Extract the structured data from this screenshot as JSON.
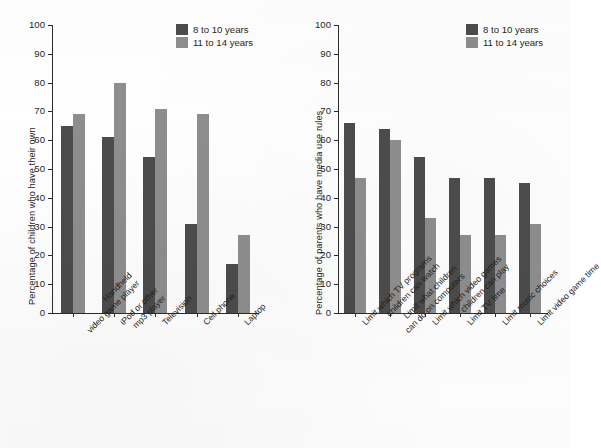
{
  "figure": {
    "background_color": "#ffffff",
    "series_colors": {
      "series_0": "#4c4c4c",
      "series_1": "#8e8e8e"
    }
  },
  "legend": {
    "entries": [
      {
        "label": "8 to 10 years",
        "color": "#4c4c4c"
      },
      {
        "label": "11 to 14 years",
        "color": "#8e8e8e"
      }
    ]
  },
  "chart_data": [
    {
      "type": "bar",
      "id": "children-own-media",
      "title": "",
      "xlabel": "",
      "ylabel": "Percentage of children who have their own",
      "ylim": [
        0,
        100
      ],
      "yticks": [
        0,
        10,
        20,
        30,
        40,
        50,
        60,
        70,
        80,
        90,
        100
      ],
      "ytick_labels": [
        "0",
        "10",
        "20",
        "30",
        "40",
        "50",
        "60",
        "70",
        "80",
        "90",
        "100"
      ],
      "grid": false,
      "legend_position": "top-right",
      "categories": [
        "Handheld\nvideo game player",
        "iPod or other\nmp3 player",
        "Television",
        "Cell phone",
        "Laptop"
      ],
      "series": [
        {
          "name": "8 to 10 years",
          "color": "#4c4c4c",
          "values": [
            65,
            61,
            54,
            31,
            17
          ]
        },
        {
          "name": "11 to 14 years",
          "color": "#8e8e8e",
          "values": [
            69,
            80,
            71,
            69,
            27
          ]
        }
      ]
    },
    {
      "type": "bar",
      "id": "parents-media-rules",
      "title": "",
      "xlabel": "",
      "ylabel": "Percentage of parents who have media use rules",
      "ylim": [
        0,
        100
      ],
      "yticks": [
        0,
        10,
        20,
        30,
        40,
        50,
        60,
        70,
        80,
        90,
        100
      ],
      "ytick_labels": [
        "0",
        "10",
        "20",
        "30",
        "40",
        "50",
        "60",
        "70",
        "80",
        "90",
        "100"
      ],
      "grid": false,
      "legend_position": "top-right",
      "categories": [
        "Limit which TV programs\nchildren can watch",
        "Limit what children\ncan do on computers",
        "Limit which video games\nchildren can play",
        "Limit TV time",
        "Limit music choices",
        "Limit video game time"
      ],
      "series": [
        {
          "name": "8 to 10 years",
          "color": "#4c4c4c",
          "values": [
            66,
            64,
            54,
            47,
            47,
            45
          ]
        },
        {
          "name": "11 to 14 years",
          "color": "#8e8e8e",
          "values": [
            47,
            60,
            33,
            27,
            27,
            31
          ]
        }
      ]
    }
  ]
}
